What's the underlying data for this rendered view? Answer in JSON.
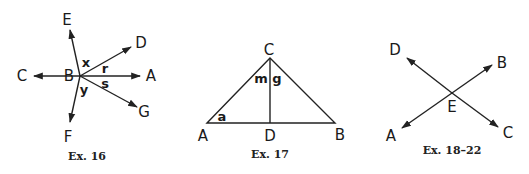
{
  "figures": [
    {
      "caption": "Ex. 16",
      "vertex": "B",
      "rays": [
        "C",
        "A",
        "E",
        "D",
        "G",
        "F"
      ],
      "angle_labels": [
        "x",
        "r",
        "s",
        "y"
      ],
      "labels": {
        "B": "B",
        "C": "C",
        "A": "A",
        "E": "E",
        "D": "D",
        "G": "G",
        "F": "F"
      }
    },
    {
      "caption": "Ex. 17",
      "shape": "triangle ABC with segment CD perpendicular to AB",
      "labels": {
        "A": "A",
        "B": "B",
        "C": "C",
        "D": "D"
      },
      "angle_labels": {
        "m": "m",
        "g": "g",
        "a": "a"
      }
    },
    {
      "caption": "Ex. 18–22",
      "intersection": "E",
      "lines": [
        "AB",
        "DC"
      ],
      "labels": {
        "A": "A",
        "B": "B",
        "C": "C",
        "D": "D",
        "E": "E"
      }
    }
  ]
}
